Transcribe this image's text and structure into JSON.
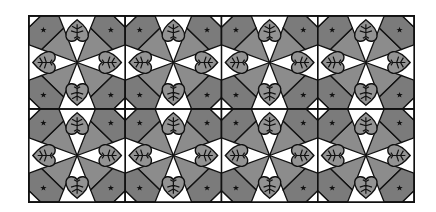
{
  "image": {
    "description": "Tessellated decorative tile pattern of gray pinwheel spokes, leaf-veined hearts and star-marked corner pentagons",
    "grid": {
      "columns": 4,
      "rows": 2
    },
    "colors": {
      "background": "#ffffff",
      "outline": "#111111",
      "spoke": "#8c8c8c",
      "corner": "#7b7b7b",
      "heart": "#939393",
      "corner_triangle": "#ffffff"
    },
    "motifs": [
      "heart-leaf",
      "pinwheel-spoke",
      "corner-pentagon",
      "star-mark",
      "corner-triangle"
    ]
  }
}
